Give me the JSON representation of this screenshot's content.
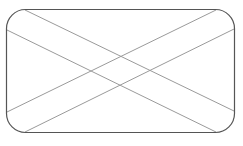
{
  "placeholder": {
    "type": "image-placeholder",
    "shape": "rounded-rectangle-with-crossing-lines",
    "frame": {
      "x": 6.5,
      "y": 9.5,
      "width": 228,
      "height": 123,
      "radius": 19
    },
    "colors": {
      "frame_stroke": "#555555",
      "line_stroke": "#9a9a9a",
      "background": "#ffffff"
    },
    "lines": [
      {
        "x1": 25,
        "y1": 10,
        "x2": 234,
        "y2": 111
      },
      {
        "x1": 7,
        "y1": 30,
        "x2": 216,
        "y2": 132
      },
      {
        "x1": 216,
        "y1": 10,
        "x2": 7,
        "y2": 112
      },
      {
        "x1": 234,
        "y1": 29,
        "x2": 25,
        "y2": 132
      }
    ]
  }
}
